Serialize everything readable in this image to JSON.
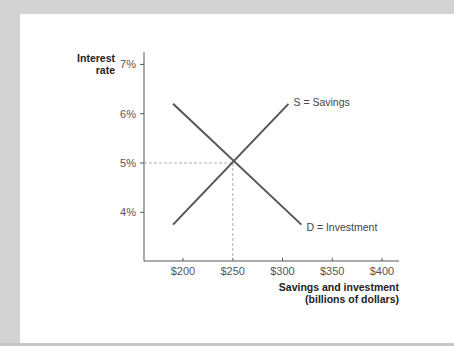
{
  "chart_data": {
    "type": "line",
    "title": "",
    "ylabel": "Interest rate",
    "xlabel": "Savings and investment (billions of dollars)",
    "xlabel_lines": [
      "Savings and investment",
      "(billions of dollars)"
    ],
    "ylabel_lines": [
      "Interest",
      "rate"
    ],
    "x_ticks": [
      "$200",
      "$250",
      "$300",
      "$350",
      "$400"
    ],
    "x_tick_values": [
      200,
      250,
      300,
      350,
      400
    ],
    "y_ticks": [
      "7%",
      "6%",
      "5%",
      "4%"
    ],
    "y_tick_values": [
      7,
      6,
      5,
      4
    ],
    "xlim": [
      160,
      410
    ],
    "ylim": [
      3.0,
      7.25
    ],
    "grid": false,
    "legend": "inline labels at line ends",
    "series": [
      {
        "name": "S = Savings",
        "points": [
          [
            190,
            3.75
          ],
          [
            306,
            6.2
          ]
        ],
        "color": "#555555"
      },
      {
        "name": "D = Investment",
        "points": [
          [
            190,
            6.2
          ],
          [
            319,
            3.75
          ]
        ],
        "color": "#555555"
      }
    ],
    "annotations": [
      {
        "type": "equilibrium",
        "x": 250,
        "y": 5,
        "style": "dashed guide lines to both axes"
      }
    ]
  },
  "colors": {
    "background": "#d3d3d3",
    "panel": "#ffffff",
    "axis": "#555555",
    "line": "#555555",
    "guide": "#999999"
  }
}
